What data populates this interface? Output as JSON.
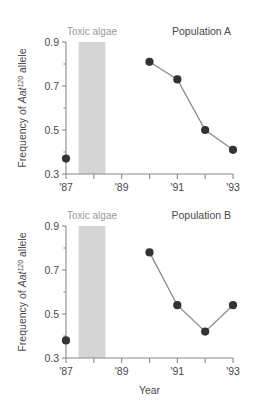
{
  "figure": {
    "axis_title_x": "Year",
    "y_axis_label_part1": "Frequency of ",
    "y_axis_label_gene": "Aat",
    "y_axis_label_superscript": "120",
    "y_axis_label_part2": " allele",
    "band_label": "Toxic algae",
    "colors": {
      "band": "#d6d6d6",
      "marker": "#333333",
      "line": "#8c8c8c",
      "axis": "#8a8a8a",
      "text": "#4a4a4a",
      "band_text": "#9a9a9a",
      "background": "#ffffff"
    }
  },
  "chart_data": [
    {
      "type": "line",
      "title": "Population A",
      "xlabel": "Year",
      "ylabel": "Frequency of Aat120 allele",
      "xlim": [
        1987,
        1993
      ],
      "ylim": [
        0.3,
        0.9
      ],
      "grid": false,
      "legend": "none",
      "x_tick_values": [
        1987,
        1988,
        1989,
        1990,
        1991,
        1992,
        1993
      ],
      "x_tick_labels": [
        "'87",
        "",
        "'89",
        "",
        "'91",
        "",
        "'93"
      ],
      "y_major_ticks": [
        0.3,
        0.5,
        0.7,
        0.9
      ],
      "y_major_tick_labels": [
        "0.3",
        "0.5",
        "0.7",
        "0.9"
      ],
      "y_minor_ticks": [
        0.4,
        0.6,
        0.8
      ],
      "shaded_band": {
        "label": "Toxic algae",
        "x_start": 1987.45,
        "x_end": 1988.42
      },
      "isolated_points": [
        {
          "x": 1987,
          "y": 0.37
        }
      ],
      "series": [
        {
          "name": "Population A",
          "x": [
            1990,
            1991,
            1992,
            1993
          ],
          "values": [
            0.81,
            0.73,
            0.5,
            0.41
          ]
        }
      ]
    },
    {
      "type": "line",
      "title": "Population B",
      "xlabel": "Year",
      "ylabel": "Frequency of Aat120 allele",
      "xlim": [
        1987,
        1993
      ],
      "ylim": [
        0.3,
        0.9
      ],
      "grid": false,
      "legend": "none",
      "x_tick_values": [
        1987,
        1988,
        1989,
        1990,
        1991,
        1992,
        1993
      ],
      "x_tick_labels": [
        "'87",
        "",
        "'89",
        "",
        "'91",
        "",
        "'93"
      ],
      "y_major_ticks": [
        0.3,
        0.5,
        0.7,
        0.9
      ],
      "y_major_tick_labels": [
        "0.3",
        "0.5",
        "0.7",
        "0.9"
      ],
      "y_minor_ticks": [
        0.4,
        0.6,
        0.8
      ],
      "shaded_band": {
        "label": "Toxic algae",
        "x_start": 1987.45,
        "x_end": 1988.42
      },
      "isolated_points": [
        {
          "x": 1987,
          "y": 0.38
        }
      ],
      "series": [
        {
          "name": "Population B",
          "x": [
            1990,
            1991,
            1992,
            1993
          ],
          "values": [
            0.78,
            0.54,
            0.42,
            0.54
          ]
        }
      ]
    }
  ]
}
